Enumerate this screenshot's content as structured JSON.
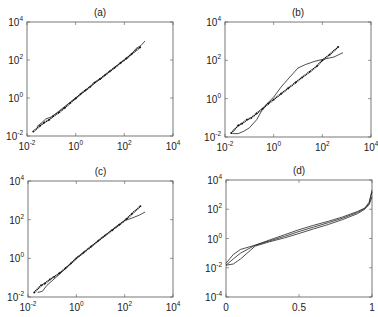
{
  "figure": {
    "panels": [
      "(a)",
      "(b)",
      "(c)",
      "(d)"
    ]
  },
  "chart_data": [
    {
      "panel": "(a)",
      "type": "scatter",
      "title": "(a)",
      "xscale": "log",
      "yscale": "log",
      "xlim": [
        0.01,
        10000
      ],
      "ylim": [
        0.01,
        10000
      ],
      "xticks": [
        "10^-2",
        "10^0",
        "10^2",
        "10^4"
      ],
      "yticks": [
        "10^-2",
        "10^0",
        "10^2",
        "10^4"
      ],
      "xlabel": "",
      "ylabel": "",
      "grid": false,
      "series": [
        {
          "name": "points",
          "style": "dots",
          "x": [
            0.018,
            0.035,
            0.05,
            0.08,
            0.12,
            0.2,
            0.35,
            0.6,
            1,
            1.6,
            2.5,
            4,
            6,
            10,
            16,
            25,
            40,
            70,
            120,
            200,
            450
          ],
          "y": [
            0.017,
            0.035,
            0.05,
            0.07,
            0.11,
            0.17,
            0.3,
            0.55,
            0.95,
            1.6,
            2.5,
            4,
            6.5,
            10,
            16,
            25,
            40,
            70,
            120,
            210,
            470
          ]
        },
        {
          "name": "curve",
          "style": "line",
          "x": [
            0.025,
            0.04,
            0.06,
            0.1,
            0.2,
            0.5,
            1,
            3,
            10,
            30,
            100,
            200,
            300,
            500,
            700
          ],
          "y": [
            0.03,
            0.05,
            0.08,
            0.1,
            0.2,
            0.5,
            1,
            3,
            10,
            30,
            100,
            200,
            400,
            600,
            1000
          ]
        }
      ]
    },
    {
      "panel": "(b)",
      "type": "scatter",
      "title": "(b)",
      "xscale": "log",
      "yscale": "log",
      "xlim": [
        0.01,
        10000
      ],
      "ylim": [
        0.01,
        10000
      ],
      "xticks": [
        "10^-2",
        "10^0",
        "10^2",
        "10^4"
      ],
      "yticks": [
        "10^-2",
        "10^0",
        "10^2",
        "10^4"
      ],
      "xlabel": "",
      "ylabel": "",
      "grid": false,
      "series": [
        {
          "name": "points",
          "style": "dots",
          "x": [
            0.018,
            0.035,
            0.05,
            0.08,
            0.12,
            0.2,
            0.35,
            0.6,
            1,
            2,
            4,
            8,
            15,
            30,
            60,
            100,
            200,
            450
          ],
          "y": [
            0.016,
            0.04,
            0.05,
            0.08,
            0.1,
            0.17,
            0.3,
            0.55,
            0.9,
            1.8,
            3.5,
            7,
            13,
            25,
            50,
            100,
            200,
            500
          ]
        },
        {
          "name": "curve",
          "style": "line",
          "x": [
            0.02,
            0.035,
            0.06,
            0.1,
            0.2,
            0.3,
            0.5,
            1,
            2,
            5,
            10,
            20,
            50,
            100,
            300,
            700
          ],
          "y": [
            0.015,
            0.015,
            0.02,
            0.03,
            0.08,
            0.2,
            0.5,
            1.2,
            4,
            15,
            40,
            60,
            90,
            110,
            150,
            250
          ]
        }
      ]
    },
    {
      "panel": "(c)",
      "type": "scatter",
      "title": "(c)",
      "xscale": "log",
      "yscale": "log",
      "xlim": [
        0.01,
        10000
      ],
      "ylim": [
        0.01,
        10000
      ],
      "xticks": [
        "10^-2",
        "10^0",
        "10^2",
        "10^4"
      ],
      "yticks": [
        "10^-2",
        "10^0",
        "10^2",
        "10^4"
      ],
      "xlabel": "",
      "ylabel": "",
      "grid": false,
      "series": [
        {
          "name": "points",
          "style": "dots",
          "x": [
            0.018,
            0.035,
            0.05,
            0.08,
            0.12,
            0.2,
            0.35,
            0.6,
            1,
            2,
            4,
            8,
            15,
            30,
            60,
            120,
            200,
            450
          ],
          "y": [
            0.017,
            0.04,
            0.05,
            0.08,
            0.11,
            0.17,
            0.3,
            0.55,
            1,
            2,
            4,
            8,
            15,
            28,
            55,
            110,
            200,
            500
          ]
        },
        {
          "name": "curve",
          "style": "line",
          "x": [
            0.025,
            0.04,
            0.06,
            0.1,
            0.2,
            0.5,
            1,
            3,
            10,
            30,
            100,
            200,
            400,
            700
          ],
          "y": [
            0.017,
            0.02,
            0.04,
            0.07,
            0.15,
            0.45,
            1,
            3,
            10,
            30,
            90,
            120,
            170,
            250
          ]
        }
      ]
    },
    {
      "panel": "(d)",
      "type": "line",
      "title": "(d)",
      "xscale": "linear",
      "yscale": "log",
      "xlim": [
        0,
        1
      ],
      "ylim": [
        0.0001,
        10000
      ],
      "xticks": [
        "0",
        "0.5",
        "1"
      ],
      "yticks": [
        "10^-4",
        "10^-2",
        "10^0",
        "10^2",
        "10^4"
      ],
      "xlabel": "",
      "ylabel": "",
      "grid": false,
      "series": [
        {
          "name": "curve 1",
          "x": [
            0,
            0.05,
            0.1,
            0.2,
            0.3,
            0.4,
            0.5,
            0.6,
            0.7,
            0.8,
            0.9,
            0.95,
            0.98,
            1.0
          ],
          "y": [
            0.02,
            0.08,
            0.18,
            0.35,
            0.8,
            1.8,
            4,
            8,
            15,
            30,
            70,
            120,
            300,
            1500
          ]
        },
        {
          "name": "curve 2",
          "x": [
            0,
            0.05,
            0.1,
            0.2,
            0.3,
            0.4,
            0.5,
            0.6,
            0.7,
            0.8,
            0.9,
            0.95,
            0.98,
            1.0
          ],
          "y": [
            0.015,
            0.04,
            0.1,
            0.35,
            0.7,
            1.4,
            3,
            6,
            12,
            25,
            60,
            110,
            200,
            700
          ]
        },
        {
          "name": "curve 3",
          "x": [
            0,
            0.05,
            0.1,
            0.2,
            0.3,
            0.4,
            0.5,
            0.6,
            0.7,
            0.8,
            0.9,
            0.95,
            0.98,
            1.0
          ],
          "y": [
            0.015,
            0.018,
            0.04,
            0.3,
            0.6,
            1.1,
            2.2,
            4.5,
            9,
            20,
            50,
            100,
            250,
            2000
          ]
        }
      ]
    }
  ]
}
